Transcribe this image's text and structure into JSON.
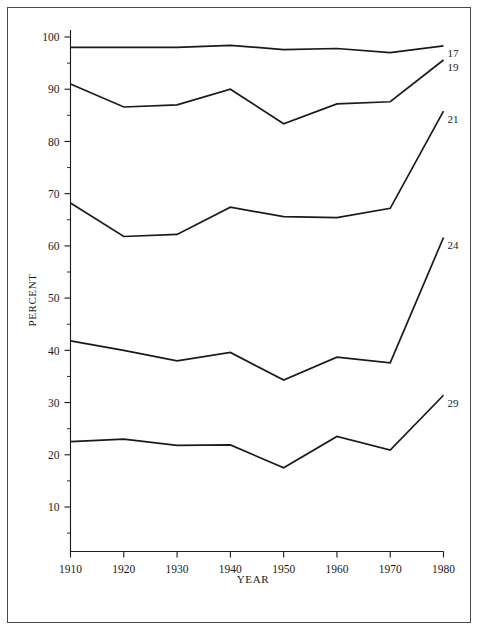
{
  "figure": {
    "background": "#ffffff",
    "border_color": "#4a4a4a",
    "line_color": "#1a1a1a"
  },
  "chart_data": {
    "type": "line",
    "title": "",
    "xlabel": "YEAR",
    "ylabel": "PERCENT",
    "x": [
      1910,
      1920,
      1930,
      1940,
      1950,
      1960,
      1970,
      1980
    ],
    "xlim": [
      1910,
      1980
    ],
    "ylim": [
      5,
      100
    ],
    "xticks": [
      1910,
      1920,
      1930,
      1940,
      1950,
      1960,
      1970,
      1980
    ],
    "xtick_labels": [
      "1910",
      "1920",
      "1930",
      "1940",
      "1950",
      "1960",
      "1970",
      "1980"
    ],
    "yticks": [
      10,
      20,
      30,
      40,
      50,
      60,
      70,
      80,
      90,
      100
    ],
    "ytick_labels": [
      "10",
      "20",
      "30",
      "40",
      "50",
      "60",
      "70",
      "80",
      "90",
      "100"
    ],
    "yticks_minor": [
      5,
      15,
      25,
      35,
      45,
      55,
      65,
      75,
      85,
      95
    ],
    "grid": false,
    "legend_position": "right-endpoint-labels",
    "series": [
      {
        "name": "17",
        "label": "17",
        "values": [
          98.0,
          98.0,
          98.0,
          98.4,
          97.6,
          97.8,
          97.0,
          98.3
        ]
      },
      {
        "name": "19",
        "label": "19",
        "values": [
          91.0,
          86.6,
          87.0,
          90.0,
          83.4,
          87.2,
          87.6,
          95.6
        ]
      },
      {
        "name": "21",
        "label": "21",
        "values": [
          68.2,
          61.8,
          62.2,
          67.4,
          65.6,
          65.4,
          67.2,
          85.8
        ]
      },
      {
        "name": "24",
        "label": "24",
        "values": [
          41.8,
          40.0,
          38.0,
          39.6,
          34.3,
          38.7,
          37.6,
          61.6
        ]
      },
      {
        "name": "29",
        "label": "29",
        "values": [
          22.5,
          23.0,
          21.8,
          21.9,
          17.5,
          23.5,
          20.9,
          31.4
        ]
      }
    ]
  }
}
